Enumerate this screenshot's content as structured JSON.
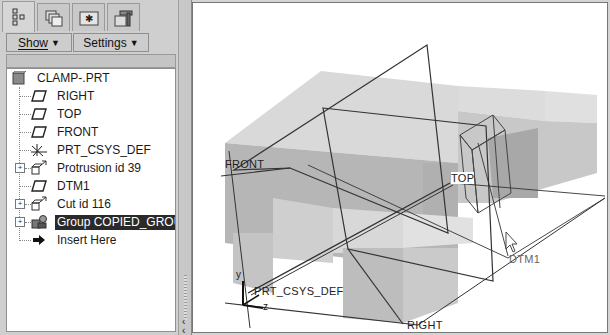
{
  "panel": {
    "tabs": [
      {
        "name": "model-tree-tab",
        "icon": "model-tree-icon",
        "active": true
      },
      {
        "name": "folder-browser-tab",
        "icon": "folder-stack-icon",
        "active": false
      },
      {
        "name": "favorites-tab",
        "icon": "folder-star-icon",
        "active": false
      },
      {
        "name": "connections-tab",
        "icon": "tools-folder-icon",
        "active": false
      }
    ],
    "show_label": "Show",
    "settings_label": "Settings"
  },
  "tree": {
    "root": "CLAMP-.PRT",
    "items": [
      {
        "label": "RIGHT",
        "icon": "datum-plane-icon",
        "expandable": false,
        "selected": false
      },
      {
        "label": "TOP",
        "icon": "datum-plane-icon",
        "expandable": false,
        "selected": false
      },
      {
        "label": "FRONT",
        "icon": "datum-plane-icon",
        "expandable": false,
        "selected": false
      },
      {
        "label": "PRT_CSYS_DEF",
        "icon": "coordinate-system-icon",
        "expandable": false,
        "selected": false
      },
      {
        "label": "Protrusion id 39",
        "icon": "extrude-feature-icon",
        "expandable": true,
        "selected": false
      },
      {
        "label": "DTM1",
        "icon": "datum-plane-icon",
        "expandable": false,
        "selected": false
      },
      {
        "label": "Cut id 116",
        "icon": "extrude-feature-icon",
        "expandable": true,
        "selected": false
      },
      {
        "label": "Group COPIED_GROUP",
        "icon": "group-icon",
        "expandable": true,
        "selected": true
      },
      {
        "label": "Insert Here",
        "icon": "insert-arrow-icon",
        "expandable": false,
        "selected": false
      }
    ]
  },
  "viewport": {
    "labels": {
      "front": "FRONT",
      "top": "TOP",
      "right": "RIGHT",
      "dtm1": "DTM1",
      "csys": "PRT_CSYS_DEF",
      "axis_y": "y",
      "axis_z": "z"
    }
  }
}
